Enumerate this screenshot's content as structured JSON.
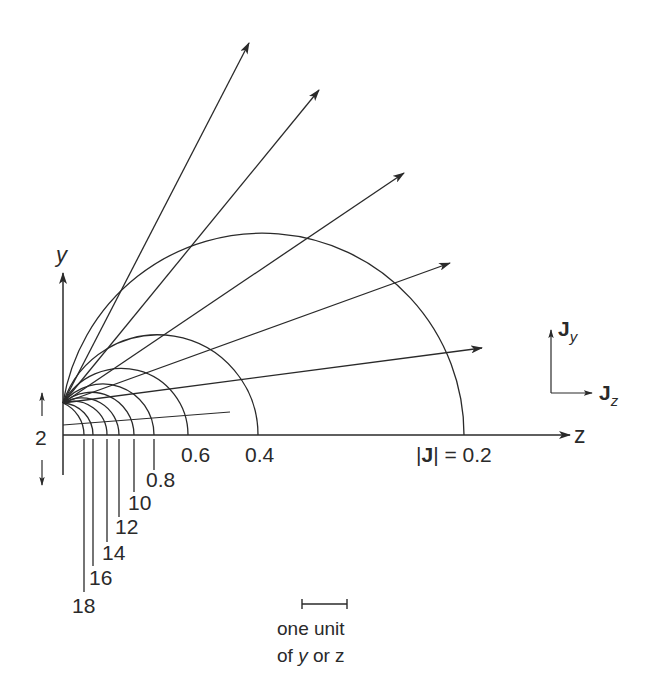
{
  "axes": {
    "y_label": "y",
    "z_label": "z",
    "origin": [
      63,
      435
    ],
    "source_point": [
      63,
      403
    ]
  },
  "contours": [
    {
      "label": "|J| = 0.2",
      "z_cross": 464
    },
    {
      "label": "0.4",
      "z_cross": 258
    },
    {
      "label": "0.6",
      "z_cross": 188
    },
    {
      "label": "0.8",
      "z_cross": 154
    },
    {
      "label": "10",
      "z_cross": 134
    },
    {
      "label": "12",
      "z_cross": 119
    },
    {
      "label": "14",
      "z_cross": 107
    },
    {
      "label": "16",
      "z_cross": 93
    },
    {
      "label": "18",
      "z_cross": 84
    }
  ],
  "rays": [
    {
      "tip": [
        249,
        43
      ]
    },
    {
      "tip": [
        319,
        90
      ]
    },
    {
      "tip": [
        404,
        173
      ]
    },
    {
      "tip": [
        450,
        263
      ]
    },
    {
      "tip": [
        482,
        348
      ]
    }
  ],
  "labels": {
    "j02_prefix": "|",
    "j02_bold": "J",
    "j02_suffix": "| = 0.2",
    "l04": "0.4",
    "l06": "0.6",
    "l08": "0.8",
    "l10": "10",
    "l12": "12",
    "l14": "14",
    "l16": "16",
    "l18": "18",
    "dimension": "2"
  },
  "legend": {
    "jy_main": "J",
    "jy_sub": "y",
    "jz_main": "J",
    "jz_sub": "z"
  },
  "scale": {
    "line1": "one unit",
    "line2_a": "of ",
    "line2_var": "y",
    "line2_b": " or z",
    "unit_px": 45
  }
}
